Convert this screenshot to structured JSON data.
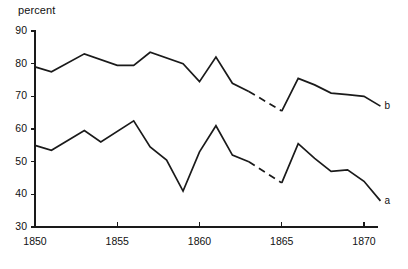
{
  "chart_data": {
    "type": "line",
    "title": "",
    "ylabel": "percent",
    "xlabel": "",
    "xlim": [
      1849.2,
      1872.6
    ],
    "ylim": [
      27.5,
      92
    ],
    "grid": false,
    "legend_position": "inline-end-of-line",
    "yticks": [
      30,
      40,
      50,
      60,
      70,
      80,
      90
    ],
    "ytick_labels": [
      "30",
      "40",
      "50",
      "60",
      "70",
      "80",
      "90"
    ],
    "xticks": [
      1850,
      1855,
      1860,
      1865,
      1870
    ],
    "xtick_labels": [
      "1850",
      "1855",
      "1860",
      "1865",
      "1870"
    ],
    "series": [
      {
        "name": "b",
        "label": "b",
        "style": "solid-with-dashed-gap",
        "x": [
          1850,
          1851,
          1853,
          1855,
          1856,
          1857,
          1859,
          1860,
          1861,
          1862,
          1863,
          1865,
          1866,
          1867,
          1868,
          1869,
          1870,
          1871
        ],
        "values": [
          79.0,
          77.5,
          83.0,
          79.5,
          79.5,
          83.5,
          80.0,
          74.5,
          82.0,
          74.0,
          71.5,
          65.5,
          75.5,
          73.5,
          71.0,
          70.5,
          70.0,
          67.0
        ],
        "dashed_segment_x": [
          1863,
          1865
        ],
        "dashed_segment_values": [
          71.5,
          65.5
        ]
      },
      {
        "name": "a",
        "label": "a",
        "style": "solid-with-dashed-gap",
        "x": [
          1850,
          1851,
          1853,
          1854,
          1856,
          1857,
          1858,
          1859,
          1860,
          1861,
          1862,
          1863,
          1865,
          1866,
          1867,
          1868,
          1869,
          1870,
          1871
        ],
        "values": [
          55.0,
          53.5,
          59.5,
          56.0,
          62.5,
          54.5,
          50.5,
          41.0,
          53.0,
          61.0,
          52.0,
          50.0,
          43.5,
          55.5,
          51.0,
          47.0,
          47.5,
          44.0,
          38.0
        ],
        "dashed_segment_x": [
          1863,
          1865
        ],
        "dashed_segment_values": [
          50.0,
          43.5
        ]
      }
    ],
    "colors": {
      "line": "#1a1a1a",
      "axis": "#1a1a1a",
      "background": "#ffffff"
    }
  },
  "labels": {
    "series_b": "b",
    "series_a": "a"
  }
}
